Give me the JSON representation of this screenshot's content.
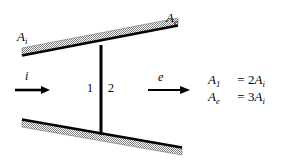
{
  "figure": {
    "background_color": "#ffffff",
    "ink_color": "#000000",
    "hatch_color": "#8c8c8c"
  },
  "labels": {
    "area_inlet": {
      "base": "A",
      "sub": "i"
    },
    "area_exit": {
      "base": "A",
      "sub": "e"
    },
    "flow_in": "i",
    "flow_out": "e",
    "station_1": "1",
    "station_2": "2"
  },
  "equations": [
    {
      "lhs_base": "A",
      "lhs_sub": "1",
      "operator": "=",
      "coefficient": "2",
      "rhs_base": "A",
      "rhs_sub": "i"
    },
    {
      "lhs_base": "A",
      "lhs_sub": "e",
      "operator": "=",
      "coefficient": "3",
      "rhs_base": "A",
      "rhs_sub": "i"
    }
  ],
  "geometry": {
    "top_wall": {
      "left_x": 22,
      "left_y": 55,
      "right_x": 178,
      "right_y": 25,
      "thickness": 7
    },
    "bottom_wall": {
      "left_x": 22,
      "left_y": 120,
      "right_x": 182,
      "right_y": 148,
      "thickness": 7
    },
    "divider_post": {
      "x": 101,
      "top_y": 45,
      "bottom_y": 135,
      "width": 3
    },
    "arrow_in": {
      "x1": 15,
      "x2": 50,
      "y": 90
    },
    "arrow_out": {
      "x1": 148,
      "x2": 190,
      "y": 90
    }
  }
}
